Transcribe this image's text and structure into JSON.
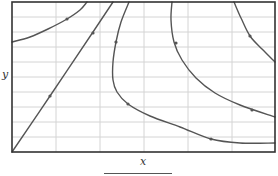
{
  "chart_data": {
    "type": "line",
    "title": "",
    "xlabel": "x",
    "ylabel": "y",
    "grid": true,
    "legend": "none",
    "frame": {
      "left": 12,
      "top": 2,
      "right": 275,
      "bottom": 152
    },
    "grid_x": [
      56,
      100,
      144,
      188,
      232
    ],
    "grid_y": [
      17,
      32,
      47,
      62,
      77,
      92,
      107,
      122,
      137
    ],
    "colors": {
      "curve": "#555555",
      "grid": "#d4d4d4",
      "frame": "#333333"
    },
    "series": [
      {
        "name": "trajectory-1",
        "points": [
          [
            12,
            42
          ],
          [
            30,
            37
          ],
          [
            48,
            29
          ],
          [
            67,
            19
          ],
          [
            80,
            10
          ],
          [
            87,
            2
          ]
        ],
        "arrows": [
          [
            67,
            19
          ]
        ]
      },
      {
        "name": "trajectory-diagonal",
        "points": [
          [
            12,
            152
          ],
          [
            50,
            96
          ],
          [
            93,
            32
          ],
          [
            113,
            2
          ]
        ],
        "arrows": [
          [
            50,
            96
          ],
          [
            93,
            33
          ]
        ]
      },
      {
        "name": "trajectory-3",
        "points": [
          [
            129,
            2
          ],
          [
            121,
            22
          ],
          [
            116,
            42
          ],
          [
            113,
            62
          ],
          [
            113,
            80
          ],
          [
            117,
            92
          ],
          [
            128,
            104
          ],
          [
            150,
            116
          ],
          [
            180,
            127
          ],
          [
            211,
            139
          ],
          [
            240,
            143
          ],
          [
            275,
            143
          ]
        ],
        "arrows": [
          [
            116,
            42
          ],
          [
            128,
            104
          ],
          [
            211,
            139
          ]
        ]
      },
      {
        "name": "trajectory-4",
        "points": [
          [
            172,
            2
          ],
          [
            171,
            20
          ],
          [
            174,
            42
          ],
          [
            182,
            60
          ],
          [
            196,
            78
          ],
          [
            215,
            93
          ],
          [
            240,
            105
          ],
          [
            275,
            117
          ]
        ],
        "arrows": [
          [
            176,
            43
          ],
          [
            252,
            110
          ]
        ]
      },
      {
        "name": "trajectory-5",
        "points": [
          [
            234,
            2
          ],
          [
            241,
            18
          ],
          [
            250,
            36
          ],
          [
            262,
            49
          ],
          [
            275,
            62
          ]
        ],
        "arrows": [
          [
            250,
            36
          ]
        ]
      }
    ]
  },
  "labels": {
    "x": "x",
    "y": "y"
  }
}
